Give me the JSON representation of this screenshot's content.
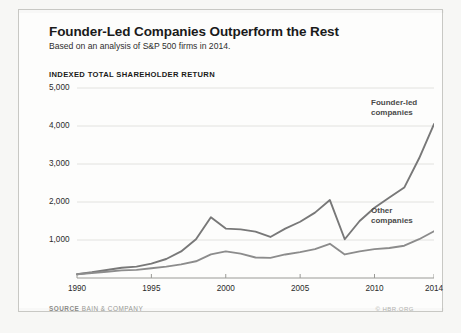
{
  "header": {
    "title": "Founder-Led Companies Outperform the Rest",
    "subtitle": "Based on an analysis of S&P 500 firms in 2014."
  },
  "footer": {
    "source_label": "SOURCE",
    "source_name": "BAIN & COMPANY",
    "credit": "© HBR.ORG"
  },
  "chart_data": {
    "type": "line",
    "title": "Founder-Led Companies Outperform the Rest",
    "subtitle": "Based on an analysis of S&P 500 firms in 2014.",
    "ylabel": "INDEXED TOTAL SHAREHOLDER RETURN",
    "xlabel": "",
    "ylim": [
      0,
      5000
    ],
    "xlim": [
      1990,
      2014
    ],
    "grid": true,
    "legend_position": "inline-annotation",
    "ytick_labels": [
      "5,000",
      "4,000",
      "3,000",
      "2,000",
      "1,000"
    ],
    "ytick_values": [
      5000,
      4000,
      3000,
      2000,
      1000
    ],
    "xtick_labels": [
      "1990",
      "1995",
      "2000",
      "2005",
      "2010",
      "2014"
    ],
    "xtick_values": [
      1990,
      1995,
      2000,
      2005,
      2010,
      2014
    ],
    "x": [
      1990,
      1991,
      1992,
      1993,
      1994,
      1995,
      1996,
      1997,
      1998,
      1999,
      2000,
      2001,
      2002,
      2003,
      2004,
      2005,
      2006,
      2007,
      2008,
      2009,
      2010,
      2011,
      2012,
      2013,
      2014
    ],
    "series": [
      {
        "name": "Founder-led companies",
        "label_lines": [
          "Founder-led",
          "companies"
        ],
        "color": "#787878",
        "values": [
          100,
          150,
          210,
          270,
          300,
          380,
          500,
          700,
          1020,
          1600,
          1300,
          1280,
          1220,
          1080,
          1300,
          1480,
          1720,
          2050,
          1020,
          1500,
          1850,
          2120,
          2380,
          3150,
          4050
        ]
      },
      {
        "name": "Other companies",
        "label_lines": [
          "Other",
          "companies"
        ],
        "color": "#8c8c8c",
        "values": [
          100,
          130,
          165,
          200,
          215,
          255,
          300,
          360,
          440,
          620,
          700,
          640,
          540,
          530,
          620,
          680,
          760,
          900,
          620,
          700,
          760,
          790,
          850,
          1020,
          1230
        ]
      }
    ],
    "annotations": [
      {
        "text": "Founder-led companies",
        "at_x": 2011,
        "at_y": 4400
      },
      {
        "text": "Other companies",
        "at_x": 2010,
        "at_y": 1850
      }
    ]
  }
}
